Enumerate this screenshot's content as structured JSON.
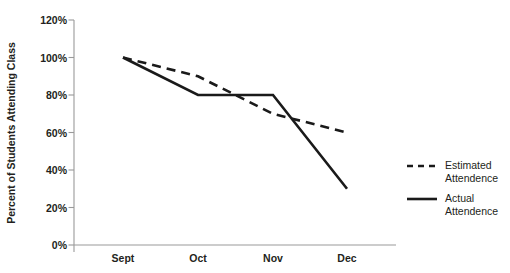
{
  "chart_data": {
    "type": "line",
    "title": "",
    "xlabel": "",
    "ylabel": "Percent of Students Attending Class",
    "categories": [
      "Sept",
      "Oct",
      "Nov",
      "Dec"
    ],
    "ylim": [
      0,
      120
    ],
    "ytick_labels": [
      "0%",
      "20%",
      "40%",
      "60%",
      "80%",
      "100%",
      "120%"
    ],
    "ytick_values": [
      0,
      20,
      40,
      60,
      80,
      100,
      120
    ],
    "grid": false,
    "legend_position": "right",
    "series": [
      {
        "name": "Estimated Attendence",
        "style": "dashed",
        "color": "#1a1a1a",
        "values": [
          100,
          90,
          70,
          60
        ]
      },
      {
        "name": "Actual Attendence",
        "style": "solid",
        "color": "#1a1a1a",
        "values": [
          100,
          80,
          80,
          30
        ]
      }
    ]
  },
  "legend": {
    "entries": [
      {
        "line1": "Estimated",
        "line2": "Attendence"
      },
      {
        "line1": "Actual",
        "line2": "Attendence"
      }
    ]
  },
  "colors": {
    "axis": "#9a9a9a",
    "ink": "#231f20",
    "series": "#1a1a1a",
    "background": "#ffffff"
  }
}
